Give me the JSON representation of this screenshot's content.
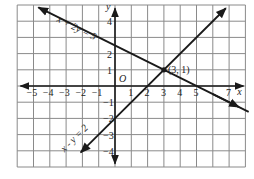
{
  "chart_data": {
    "type": "line",
    "title": "",
    "xlabel": "x",
    "ylabel": "y",
    "origin_label": "O",
    "xlim": [
      -6,
      8
    ],
    "ylim": [
      -5,
      5
    ],
    "grid": true,
    "x_tick_labels": [
      "-5",
      "-4",
      "-3",
      "-2",
      "-1",
      "1",
      "2",
      "3",
      "4",
      "5",
      "7"
    ],
    "y_tick_labels": [
      "4",
      "2",
      "1",
      "-1",
      "-2",
      "-3",
      "-4"
    ],
    "series": [
      {
        "name": "x + 2y = 5",
        "equation": "x + 2y = 5",
        "slope": -0.5,
        "intercept": 2.5,
        "x": [
          -5,
          9
        ],
        "y": [
          5,
          -2
        ]
      },
      {
        "name": "x - y = 2",
        "equation": "x - y = 2",
        "slope": 1,
        "intercept": -2,
        "x": [
          -2,
          7
        ],
        "y": [
          -4,
          5
        ]
      }
    ],
    "annotations": [
      {
        "text": "(3, 1)",
        "x": 3,
        "y": 1,
        "type": "intersection-point"
      }
    ],
    "colors": {
      "grid": "#8a8a8a",
      "axes": "#1a1a1a",
      "lines": "#1a1a1a"
    }
  }
}
